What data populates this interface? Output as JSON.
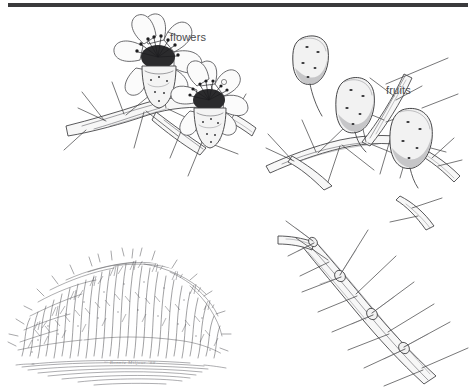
{
  "plate": {
    "background_color": "#ffffff",
    "ink_color": "#3c3c3e",
    "rule_color": "#3a3a3c",
    "medium": "pen-and-ink line drawing"
  },
  "labels": {
    "flowers": "flowers",
    "fruits": "fruits"
  },
  "signature": "© Bonnie Miljour  ’88",
  "panels": {
    "flowers": {
      "name": "flowering-branch",
      "caption": "flowers",
      "flower_count": 2,
      "petals_per_flower": 7,
      "features": "two open flowers with dark stamen clusters on a thorny woody branch"
    },
    "fruits": {
      "name": "fruiting-branch",
      "caption": "fruits",
      "fruit_count": 3,
      "features": "three oblong speckled fruits on a thorny woody branch"
    },
    "habit": {
      "name": "shrub-habit",
      "caption": "",
      "features": "dense rounded shrub in habit view with hatched ground line"
    },
    "thorns": {
      "name": "thorny-stem-detail",
      "caption": "",
      "features": "close detail of woody stem bearing paired straight thorns at the nodes"
    }
  }
}
